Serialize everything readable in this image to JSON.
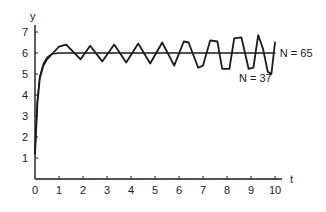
{
  "chart_data": {
    "type": "line",
    "title": "",
    "xlabel": "t",
    "ylabel": "y",
    "xlim": [
      0,
      10
    ],
    "ylim": [
      0,
      7
    ],
    "grid": false,
    "x_ticks": [
      "0",
      "1",
      "2",
      "3",
      "4",
      "5",
      "6",
      "7",
      "8",
      "9",
      "10"
    ],
    "y_ticks": [
      "1",
      "2",
      "3",
      "4",
      "5",
      "6",
      "7"
    ],
    "series": [
      {
        "name": "N = 65",
        "points": [
          [
            0,
            1.2
          ],
          [
            0.1,
            3.8
          ],
          [
            0.2,
            4.9
          ],
          [
            0.35,
            5.5
          ],
          [
            0.5,
            5.8
          ],
          [
            0.7,
            5.95
          ],
          [
            1.0,
            6.0
          ],
          [
            2,
            6.0
          ],
          [
            3,
            6.0
          ],
          [
            4,
            6.0
          ],
          [
            5,
            6.0
          ],
          [
            6,
            6.0
          ],
          [
            7,
            6.0
          ],
          [
            8,
            6.0
          ],
          [
            9,
            6.0
          ],
          [
            10,
            6.0
          ]
        ]
      },
      {
        "name": "N = 37",
        "points": [
          [
            0,
            1.2
          ],
          [
            0.1,
            3.6
          ],
          [
            0.2,
            4.8
          ],
          [
            0.35,
            5.4
          ],
          [
            0.5,
            5.7
          ],
          [
            0.75,
            6.0
          ],
          [
            1.0,
            6.3
          ],
          [
            1.3,
            6.4
          ],
          [
            1.9,
            5.7
          ],
          [
            2.3,
            6.35
          ],
          [
            2.8,
            5.6
          ],
          [
            3.3,
            6.4
          ],
          [
            3.8,
            5.55
          ],
          [
            4.3,
            6.45
          ],
          [
            4.8,
            5.5
          ],
          [
            5.3,
            6.5
          ],
          [
            5.8,
            5.4
          ],
          [
            6.2,
            6.55
          ],
          [
            6.4,
            6.5
          ],
          [
            6.8,
            5.3
          ],
          [
            7.0,
            5.4
          ],
          [
            7.3,
            6.6
          ],
          [
            7.6,
            6.55
          ],
          [
            7.8,
            5.25
          ],
          [
            8.1,
            5.25
          ],
          [
            8.3,
            6.7
          ],
          [
            8.6,
            6.75
          ],
          [
            8.9,
            5.25
          ],
          [
            9.1,
            5.3
          ],
          [
            9.3,
            6.85
          ],
          [
            9.5,
            6.2
          ],
          [
            9.7,
            5.1
          ],
          [
            9.85,
            5.0
          ],
          [
            10.0,
            6.5
          ]
        ]
      }
    ],
    "annotations": [
      {
        "text": "N = 65",
        "x": 10.2,
        "y": 6.0
      },
      {
        "text": "N = 37",
        "x": 8.5,
        "y": 4.8
      }
    ]
  }
}
